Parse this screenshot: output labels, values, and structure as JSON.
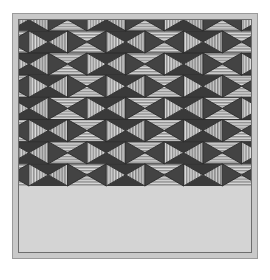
{
  "artwork": {
    "title": "Tessellated Triangle Pattern",
    "description": "Repeating hexagonal tiling of solid dark and striped light triangles",
    "canvas": {
      "width": 270,
      "height": 280
    },
    "frame": {
      "margin_left": 12,
      "margin_top": 13,
      "size": 246,
      "outer_border_color": "#9a9a9a",
      "mat_color": "#c9c9c9",
      "inner_border_color": "#6e6e6e",
      "field_color": "#d4d4d4"
    },
    "palette": {
      "dark": "#3a3a3a",
      "dark_alt": "#434343",
      "light": "#d8d8d8",
      "light_alt": "#c2c2c2",
      "stripe_dark": "#8f8f8f",
      "stripe_light": "#e2e2e2",
      "line": "#2b2b2b",
      "background": "#ffffff"
    },
    "tiling": {
      "type": "triangular-hexagonal",
      "period_x": 41,
      "period_y": 47,
      "half_period_x": 20.5,
      "half_period_y": 23.5,
      "columns": 6,
      "rows": 6,
      "stripe_spacing": 3,
      "stripe_width": 1.6
    },
    "motif": {
      "name": "six-triangle-hexagon",
      "triangle_count": 6,
      "fills": [
        "solid-dark",
        "horizontal-stripes",
        "vertical-stripes",
        "solid-dark",
        "horizontal-stripes",
        "vertical-stripes"
      ]
    }
  }
}
